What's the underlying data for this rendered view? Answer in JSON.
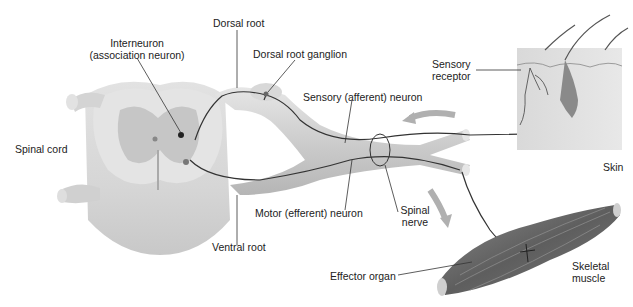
{
  "figure": {
    "type": "reflex-arc diagram",
    "labels": {
      "dorsal_root": "Dorsal root",
      "interneuron_line1": "Interneuron",
      "interneuron_line2": "(association neuron)",
      "dorsal_root_ganglion": "Dorsal root ganglion",
      "sensory_receptor_line1": "Sensory",
      "sensory_receptor_line2": "receptor",
      "sensory_neuron": "Sensory (afferent) neuron",
      "spinal_cord": "Spinal cord",
      "skin": "Skin",
      "spinal_nerve_line1": "Spinal",
      "spinal_nerve_line2": "nerve",
      "motor_neuron": "Motor (efferent) neuron",
      "ventral_root": "Ventral root",
      "effector_organ": "Effector organ",
      "skeletal_muscle_line1": "Skeletal",
      "skeletal_muscle_line2": "muscle"
    },
    "colors": {
      "cord": "#d8d8d8",
      "grey_matter": "#c4c4c4",
      "nerve": "#cfcfcf",
      "neuron_line": "#333333",
      "arrow": "#b0b0b0",
      "skin": "#dcdcdc",
      "muscle": "#6a6a6a"
    }
  }
}
